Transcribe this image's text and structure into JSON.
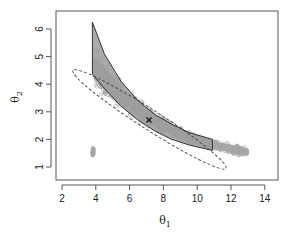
{
  "chart_data": {
    "type": "scatter",
    "title": "",
    "xlabel": "θ1",
    "ylabel": "θ2",
    "xlim": [
      1.6,
      14.8
    ],
    "ylim": [
      0.55,
      6.65
    ],
    "x_ticks": [
      2,
      4,
      6,
      8,
      10,
      12,
      14
    ],
    "y_ticks": [
      1,
      2,
      3,
      4,
      5,
      6
    ],
    "grid": false,
    "legend": null,
    "annotations": [
      {
        "type": "marker",
        "symbol": "x",
        "x": 7.15,
        "y": 2.7,
        "label": "point estimate"
      }
    ],
    "series": [
      {
        "name": "posterior samples",
        "kind": "scatter-cloud",
        "color": "#a0a0a0",
        "description": "dense band of gray circles curving from (3.8, 5.0) down to (13.0, 1.5)",
        "centerline": [
          [
            3.9,
            4.6
          ],
          [
            5.0,
            3.9
          ],
          [
            6.0,
            3.3
          ],
          [
            7.0,
            2.85
          ],
          [
            8.0,
            2.5
          ],
          [
            9.0,
            2.2
          ],
          [
            10.0,
            1.98
          ],
          [
            11.0,
            1.8
          ],
          [
            12.0,
            1.65
          ],
          [
            13.0,
            1.55
          ]
        ]
      },
      {
        "name": "joint confidence region (solid)",
        "kind": "polygon",
        "color": "#333333",
        "fill": "#9a9a9a",
        "upper": [
          [
            3.8,
            6.25
          ],
          [
            4.5,
            5.1
          ],
          [
            5.5,
            4.1
          ],
          [
            6.5,
            3.4
          ],
          [
            7.5,
            2.9
          ],
          [
            8.5,
            2.55
          ],
          [
            9.5,
            2.25
          ],
          [
            10.9,
            2.0
          ]
        ],
        "lower": [
          [
            3.8,
            4.35
          ],
          [
            4.5,
            3.85
          ],
          [
            5.5,
            3.2
          ],
          [
            6.5,
            2.7
          ],
          [
            7.5,
            2.3
          ],
          [
            8.5,
            2.0
          ],
          [
            9.5,
            1.8
          ],
          [
            10.9,
            1.6
          ]
        ]
      },
      {
        "name": "asymptotic confidence ellipse (dashed)",
        "kind": "ellipse",
        "color": "#333333",
        "dash": true,
        "center": [
          7.2,
          2.72
        ],
        "tip_upper_left": [
          2.65,
          4.5
        ],
        "tip_lower_right": [
          11.7,
          0.95
        ]
      }
    ]
  }
}
